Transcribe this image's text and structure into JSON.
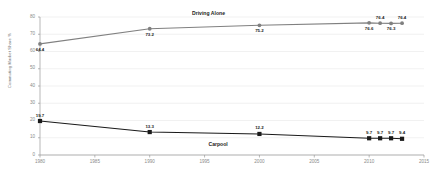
{
  "chart_data": {
    "type": "line",
    "title": "",
    "xlabel": "",
    "ylabel": "Commuting Market Share %",
    "xlim": [
      1980,
      2015
    ],
    "ylim": [
      0,
      80
    ],
    "xticks": [
      "1980",
      "1985",
      "1990",
      "1995",
      "2000",
      "2005",
      "2010",
      "2015"
    ],
    "yticks": [
      "0",
      "10",
      "20",
      "30",
      "40",
      "50",
      "60",
      "70",
      "80"
    ],
    "grid": true,
    "legend_position": "inline-series-labels",
    "x": [
      1980,
      1990,
      2000,
      2010,
      2011,
      2012,
      2013
    ],
    "series": [
      {
        "name": "Driving Alone",
        "color": "#808080",
        "marker": "circle",
        "values": [
          64.4,
          73.2,
          75.2,
          76.6,
          76.4,
          76.3,
          76.4
        ],
        "point_labels": [
          "64.4",
          "73.2",
          "75.2",
          "76.6",
          "76.4",
          "76.3",
          "76.4"
        ],
        "label_side": [
          "below",
          "below",
          "below",
          "below",
          "above",
          "below",
          "above"
        ]
      },
      {
        "name": "Carpool",
        "color": "#1a1a1a",
        "marker": "square",
        "values": [
          19.7,
          13.3,
          12.2,
          9.7,
          9.7,
          9.7,
          9.4
        ],
        "point_labels": [
          "19.7",
          "13.3",
          "12.2",
          "9.7",
          "9.7",
          "9.7",
          "9.4"
        ],
        "label_side": [
          "above",
          "above",
          "above",
          "above",
          "above",
          "above",
          "above"
        ]
      }
    ],
    "series_annotations": [
      {
        "text": "Driving Alone",
        "x": 1995.5,
        "y_px": 10
      },
      {
        "text": "Carpool",
        "x": 1997.0,
        "y_px": 141
      }
    ]
  },
  "colors": {
    "background": "#ffffff",
    "axis": "#9a9a9a",
    "grid": "#dcdcdc",
    "tick_text": "#8a8a8a",
    "label_text": "#1a1a1a",
    "driving_alone": "#808080",
    "carpool": "#1a1a1a"
  }
}
